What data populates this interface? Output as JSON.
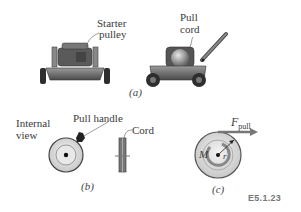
{
  "figure": {
    "id_label": "E5.1.23",
    "panels": [
      {
        "caption": "(a)",
        "labels": [
          "Starter pulley",
          "Pull cord"
        ],
        "items": [
          "lawn-mower-front-view",
          "lawn-mower-side-view"
        ]
      },
      {
        "caption": "(b)",
        "labels": [
          "Internal view",
          "Pull handle",
          "Cord"
        ],
        "items": [
          "pulley-front-view",
          "pulley-edge-view"
        ]
      },
      {
        "caption": "(c)",
        "labels": [
          "F_pull",
          "M",
          "r"
        ],
        "items": [
          "pulley-free-body-diagram"
        ]
      }
    ]
  },
  "labels": {
    "starter_line1": "Starter",
    "starter_line2": "pulley",
    "pull_line1": "Pull",
    "pull_line2": "cord",
    "internal_line1": "Internal",
    "internal_line2": "view",
    "pull_handle": "Pull handle",
    "cord": "Cord",
    "f_main": "F",
    "f_sub": "pull",
    "moment": "M",
    "radius": "r"
  },
  "captions": {
    "a": "(a)",
    "b": "(b)",
    "c": "(c)"
  },
  "colors": {
    "arrow": "#777777",
    "mower_dark": "#3a3a3a",
    "mower_mid": "#6b6b6b",
    "disk_light": "#e0e0e0"
  }
}
